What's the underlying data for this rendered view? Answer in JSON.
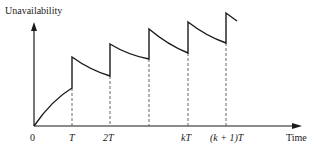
{
  "diagram": {
    "type": "sawtooth-unavailability",
    "y_axis_label": "Unavailability",
    "x_axis_label": "Time",
    "origin_label": "0",
    "tick_labels": [
      "T",
      "2T",
      "",
      "kT",
      "(k + 1)T"
    ],
    "colors": {
      "line": "#1a1a1a",
      "dashed": "#555555",
      "text": "#222222",
      "background": "#ffffff"
    }
  }
}
